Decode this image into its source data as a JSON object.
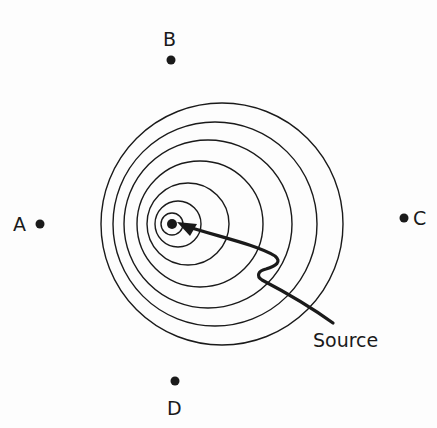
{
  "diagram": {
    "ink_color": "#1a1a1a",
    "source": {
      "label": "Source",
      "x": 172,
      "y": 224,
      "label_x": 313,
      "label_y": 331
    },
    "wavefronts": [
      {
        "cx": 172,
        "cy": 224,
        "r": 11
      },
      {
        "cx": 178,
        "cy": 224,
        "r": 23
      },
      {
        "cx": 188,
        "cy": 224,
        "r": 41
      },
      {
        "cx": 200,
        "cy": 224,
        "r": 63
      },
      {
        "cx": 208,
        "cy": 224,
        "r": 84
      },
      {
        "cx": 215,
        "cy": 224,
        "r": 102
      },
      {
        "cx": 222,
        "cy": 224,
        "r": 121
      }
    ],
    "observers": [
      {
        "name": "A",
        "label": "A",
        "dot_x": 40,
        "dot_y": 224,
        "label_x": 13,
        "label_y": 215
      },
      {
        "name": "B",
        "label": "B",
        "dot_x": 171,
        "dot_y": 60,
        "label_x": 163,
        "label_y": 30
      },
      {
        "name": "C",
        "label": "C",
        "dot_x": 404,
        "dot_y": 218,
        "label_x": 413,
        "label_y": 209
      },
      {
        "name": "D",
        "label": "D",
        "dot_x": 175,
        "dot_y": 381,
        "label_x": 167,
        "label_y": 399
      }
    ]
  }
}
